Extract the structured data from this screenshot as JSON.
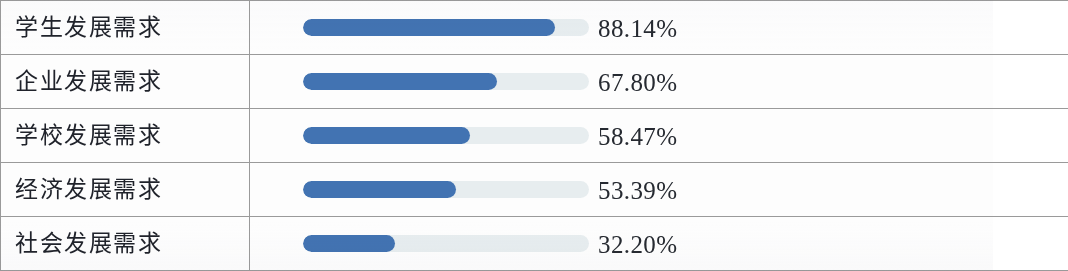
{
  "document": {
    "kind": "scanned-table-bar-chart",
    "row_count": 5
  },
  "colors": {
    "bar_fill": "#4273b2",
    "bar_track": "#e7edef",
    "table_rule": "#9a9a9a",
    "text": "#20232b",
    "page_background": "#fdfdfd"
  },
  "rows": [
    {
      "label": "学生发展需求",
      "value_label": "88.14%",
      "value": 88.14
    },
    {
      "label": "企业发展需求",
      "value_label": "67.80%",
      "value": 67.8
    },
    {
      "label": "学校发展需求",
      "value_label": "58.47%",
      "value": 58.47
    },
    {
      "label": "经济发展需求",
      "value_label": "53.39%",
      "value": 53.39
    },
    {
      "label": "社会发展需求",
      "value_label": "32.20%",
      "value": 32.2
    }
  ],
  "chart_data": {
    "type": "bar",
    "orientation": "horizontal",
    "title": "",
    "subtitle": "",
    "xlabel": "",
    "ylabel": "",
    "categories": [
      "学生发展需求",
      "企业发展需求",
      "学校发展需求",
      "经济发展需求",
      "社会发展需求"
    ],
    "values": [
      88.14,
      67.8,
      58.47,
      53.39,
      32.2
    ],
    "value_labels": [
      "88.14%",
      "67.80%",
      "58.47%",
      "53.39%",
      "32.20%"
    ],
    "xlim": [
      0,
      100
    ],
    "unit": "%",
    "grid": false,
    "legend": null,
    "series": [
      {
        "name": "占比",
        "values": [
          88.14,
          67.8,
          58.47,
          53.39,
          32.2
        ]
      }
    ],
    "annotations": []
  }
}
